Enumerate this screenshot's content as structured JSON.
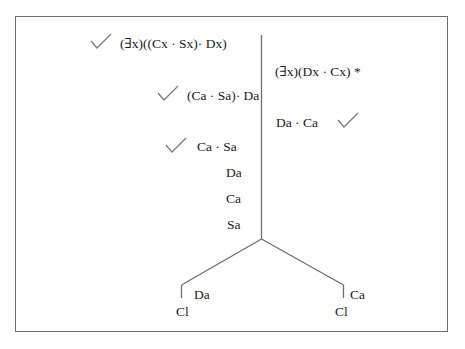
{
  "diagram": {
    "type": "truth-tree",
    "left_column": [
      {
        "text": "(∃x)((Cx · Sx)· Dx)",
        "checked": true
      },
      {
        "text": "(Ca · Sa)· Da",
        "checked": true
      },
      {
        "text": "Ca · Sa",
        "checked": true
      },
      {
        "text": "Da",
        "checked": false
      },
      {
        "text": "Ca",
        "checked": false
      },
      {
        "text": "Sa",
        "checked": false
      }
    ],
    "right_column": [
      {
        "text": "(∃x)(Dx · Cx) *",
        "checked": false
      },
      {
        "text": "Da · Ca",
        "checked": true
      }
    ],
    "branches": [
      {
        "side": "left",
        "text": "Da",
        "closed_label": "Cl"
      },
      {
        "side": "right",
        "text": "Ca",
        "closed_label": "Cl"
      }
    ]
  },
  "colors": {
    "line": "#6e6e6e",
    "text": "#1a1a1a",
    "check": "#7a7a7a"
  }
}
